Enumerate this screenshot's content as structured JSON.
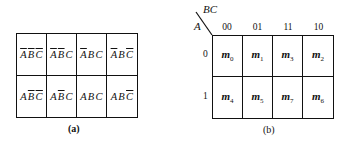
{
  "figure_a": {
    "caption": "(a)",
    "rows": [
      [
        [
          {
            "v": "A",
            "bar": true
          },
          {
            "v": "B",
            "bar": true
          },
          {
            "v": "C",
            "bar": true
          }
        ],
        [
          {
            "v": "A",
            "bar": true
          },
          {
            "v": "B",
            "bar": true
          },
          {
            "v": "C",
            "bar": false
          }
        ],
        [
          {
            "v": "A",
            "bar": true
          },
          {
            "v": "B",
            "bar": false
          },
          {
            "v": "C",
            "bar": false
          }
        ],
        [
          {
            "v": "A",
            "bar": true
          },
          {
            "v": "B",
            "bar": false
          },
          {
            "v": "C",
            "bar": true
          }
        ]
      ],
      [
        [
          {
            "v": "A",
            "bar": false
          },
          {
            "v": "B",
            "bar": true
          },
          {
            "v": "C",
            "bar": true
          }
        ],
        [
          {
            "v": "A",
            "bar": false
          },
          {
            "v": "B",
            "bar": true
          },
          {
            "v": "C",
            "bar": false
          }
        ],
        [
          {
            "v": "A",
            "bar": false
          },
          {
            "v": "B",
            "bar": false
          },
          {
            "v": "C",
            "bar": false
          }
        ],
        [
          {
            "v": "A",
            "bar": false
          },
          {
            "v": "B",
            "bar": false
          },
          {
            "v": "C",
            "bar": true
          }
        ]
      ]
    ]
  },
  "figure_b": {
    "caption": "(b)",
    "col_var": "BC",
    "row_var": "A",
    "col_headers": [
      "00",
      "01",
      "11",
      "10"
    ],
    "row_headers": [
      "0",
      "1"
    ],
    "cells": [
      [
        {
          "m": "m",
          "i": "0"
        },
        {
          "m": "m",
          "i": "1"
        },
        {
          "m": "m",
          "i": "3"
        },
        {
          "m": "m",
          "i": "2"
        }
      ],
      [
        {
          "m": "m",
          "i": "4"
        },
        {
          "m": "m",
          "i": "5"
        },
        {
          "m": "m",
          "i": "7"
        },
        {
          "m": "m",
          "i": "6"
        }
      ]
    ]
  }
}
